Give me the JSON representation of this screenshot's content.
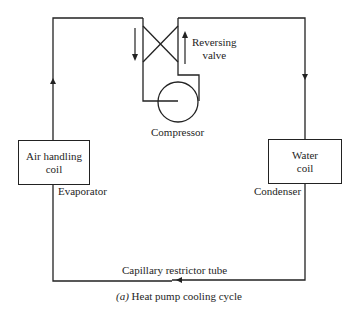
{
  "diagram": {
    "components": {
      "reversing_valve": "Reversing\nvalve",
      "reversing_valve_line1": "Reversing",
      "reversing_valve_line2": "valve",
      "compressor": "Compressor",
      "air_handling_coil_line1": "Air handling",
      "air_handling_coil_line2": "coil",
      "evaporator": "Evaporator",
      "water_coil_line1": "Water",
      "water_coil_line2": "coil",
      "condenser": "Condenser",
      "capillary_tube": "Capillary restrictor tube"
    },
    "caption": {
      "prefix": "(a)",
      "text": "Heat pump cooling cycle"
    },
    "flow": {
      "left_line": "up",
      "right_line": "down",
      "bottom_line": "left",
      "valve_left_arrow": "down",
      "valve_right_arrow": "up"
    },
    "colors": {
      "line": "#222222",
      "background": "#ffffff"
    }
  }
}
